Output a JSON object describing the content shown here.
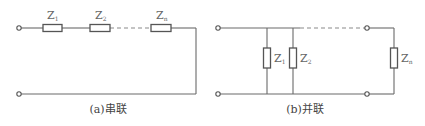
{
  "series": {
    "caption": "(a)串联",
    "impedances": [
      {
        "symbol": "Z",
        "sub": "1"
      },
      {
        "symbol": "Z",
        "sub": "2"
      },
      {
        "symbol": "Z",
        "sub": "n"
      }
    ]
  },
  "parallel": {
    "caption": "(b)并联",
    "impedances": [
      {
        "symbol": "Z",
        "sub": "1"
      },
      {
        "symbol": "Z",
        "sub": "2"
      },
      {
        "symbol": "Z",
        "sub": "n"
      }
    ]
  }
}
